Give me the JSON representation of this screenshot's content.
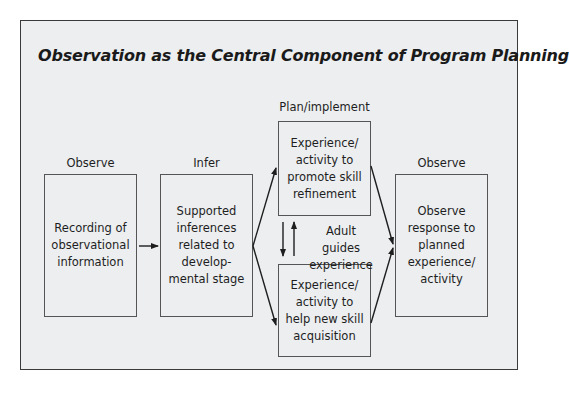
{
  "title": "Observation as the Central Component of Program Planning",
  "stages": {
    "observe1": {
      "heading": "Observe",
      "box": "Recording of\nobservational\ninformation"
    },
    "infer": {
      "heading": "Infer",
      "box": "Supported\ninferences\nrelated to\ndevelop-\nmental stage"
    },
    "plan": {
      "heading": "Plan/implement",
      "top_box": "Experience/\nactivity to\npromote skill\nrefinement",
      "bottom_box": "Experience/\nactivity to\nhelp new skill\nacquisition",
      "between_label": "Adult guides\nexperience"
    },
    "observe2": {
      "heading": "Observe",
      "box": "Observe\nresponse to\nplanned\nexperience/\nactivity"
    }
  },
  "colors": {
    "background": "#eceef0",
    "border": "#3a3a3a",
    "text": "#1e1e1e"
  }
}
